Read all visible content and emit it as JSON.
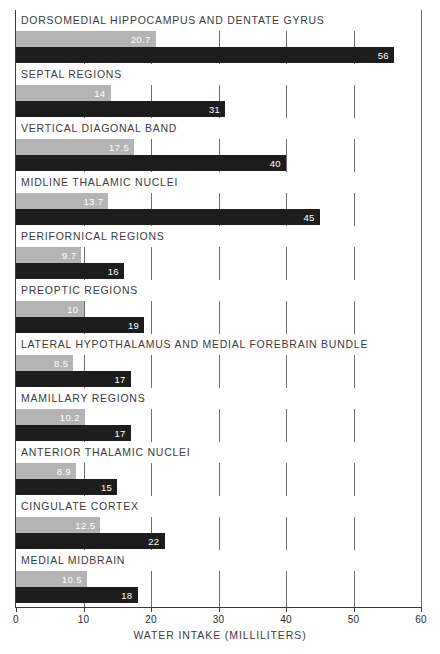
{
  "chart_data": {
    "type": "bar",
    "orientation": "horizontal",
    "title": "",
    "xlabel": "WATER INTAKE (MILLILITERS)",
    "ylabel": "",
    "xlim": [
      0,
      60
    ],
    "xticks": [
      0,
      10,
      20,
      30,
      40,
      50,
      60
    ],
    "xtick_labels": [
      "0",
      "10",
      "20",
      "30",
      "40",
      "50",
      "60"
    ],
    "grid": true,
    "legend": "none",
    "categories": [
      "DORSOMEDIAL HIPPOCAMPUS AND DENTATE GYRUS",
      "SEPTAL REGIONS",
      "VERTICAL DIAGONAL BAND",
      "MIDLINE THALAMIC NUCLEI",
      "PERIFORNICAL REGIONS",
      "PREOPTIC REGIONS",
      "LATERAL HYPOTHALAMUS AND MEDIAL FOREBRAIN BUNDLE",
      "MAMILLARY REGIONS",
      "ANTERIOR THALAMIC NUCLEI",
      "CINGULATE CORTEX",
      "MEDIAL MIDBRAIN"
    ],
    "series": [
      {
        "name": "light",
        "color": "#b4b4b4",
        "values": [
          20.7,
          14,
          17.5,
          13.7,
          9.7,
          10,
          8.5,
          10.2,
          8.9,
          12.5,
          10.5
        ],
        "labels": [
          "20.7",
          "14",
          "17.5",
          "13.7",
          "9.7",
          "10",
          "8.5",
          "10.2",
          "8.9",
          "12.5",
          "10.5"
        ]
      },
      {
        "name": "dark",
        "color": "#1d1d1d",
        "values": [
          56,
          31,
          40,
          45,
          16,
          19,
          17,
          17,
          15,
          22,
          18
        ],
        "labels": [
          "56",
          "31",
          "40",
          "45",
          "16",
          "19",
          "17",
          "17",
          "15",
          "22",
          "18"
        ]
      }
    ]
  },
  "colors": {
    "light_bar": "#b4b4b4",
    "dark_bar": "#1d1d1d",
    "axis": "#3a3a3a",
    "gridline": "#6e6e6e",
    "text": "#3c3c3c",
    "bar_value_text": "#ffffff",
    "background": "#ffffff"
  }
}
